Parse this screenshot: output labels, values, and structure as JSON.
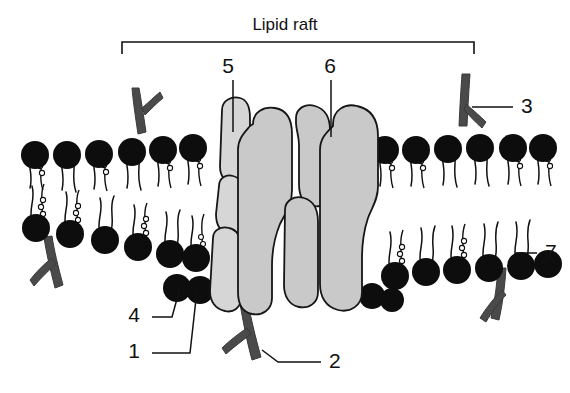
{
  "figure": {
    "title": "Lipid raft",
    "background_color": "#ffffff",
    "protein_fill_color": "#c9c9c9",
    "head_group_color": "#0d0d0d",
    "glycolipid_color": "#4a4a4a",
    "label_color": "#111111"
  },
  "bracket": {
    "label": "Lipid raft",
    "left_x": 122,
    "right_x": 474,
    "top_y": 42,
    "tick_depth": 12
  },
  "callouts": [
    {
      "id": "1",
      "label": "1",
      "text_x": 140,
      "text_y": 358,
      "target_x": 197,
      "target_y": 290
    },
    {
      "id": "2",
      "label": "2",
      "text_x": 329,
      "text_y": 368,
      "target_x": 262,
      "target_y": 350
    },
    {
      "id": "3",
      "label": "3",
      "text_x": 521,
      "text_y": 113,
      "target_x": 472,
      "target_y": 107
    },
    {
      "id": "4",
      "label": "4",
      "text_x": 140,
      "text_y": 322,
      "target_x": 180,
      "target_y": 288
    },
    {
      "id": "5",
      "label": "5",
      "text_x": 228,
      "text_y": 73,
      "target_x": 233,
      "target_y": 132
    },
    {
      "id": "6",
      "label": "6",
      "text_x": 330,
      "text_y": 73,
      "target_x": 331,
      "target_y": 137
    },
    {
      "id": "7",
      "label": "7",
      "text_x": 545,
      "text_y": 259,
      "target_x": 515,
      "target_y": 253
    }
  ],
  "structures": {
    "upper_leaflet_name": "phospholipid-upper-leaflet",
    "lower_leaflet_name": "phospholipid-lower-leaflet",
    "cholesterol_column_name": "cholesterol-stack",
    "integral_proteins_name": "integral-membrane-proteins",
    "glycolipid_names": [
      "glycolipid-upper-left",
      "glycolipid-upper-right",
      "glycolipid-lower-left",
      "glycolipid-lower-center",
      "glycolipid-lower-right"
    ]
  }
}
